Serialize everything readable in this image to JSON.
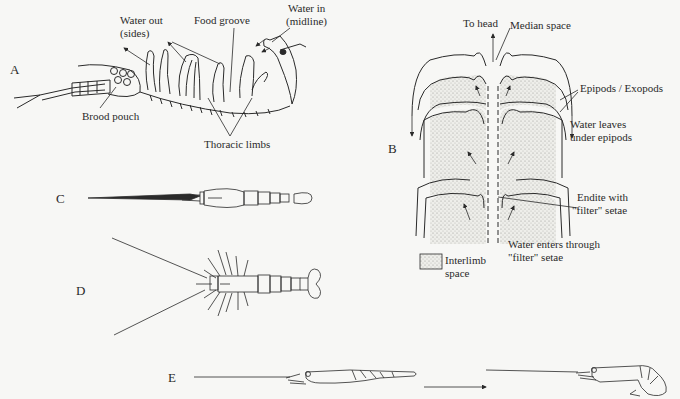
{
  "panels": {
    "A": {
      "letter": "A",
      "labels": {
        "water_out": "Water out",
        "water_out_sides": "(sides)",
        "food_groove": "Food groove",
        "water_in": "Water in",
        "water_in_midline": "(midline)",
        "brood_pouch": "Brood pouch",
        "thoracic_limbs": "Thoracic limbs"
      }
    },
    "B": {
      "letter": "B",
      "labels": {
        "to_head": "To head",
        "median_space": "Median space",
        "epipods_exopods": "Epipods / Exopods",
        "water_leaves_1": "Water leaves",
        "water_leaves_2": "under epipods",
        "endite_1": "Endite with",
        "endite_2": "\"filter\" setae",
        "water_enters_1": "Water enters through",
        "water_enters_2": "\"filter\" setae",
        "legend_1": "Interlimb",
        "legend_2": "space"
      }
    },
    "C": {
      "letter": "C"
    },
    "D": {
      "letter": "D"
    },
    "E": {
      "letter": "E"
    }
  },
  "colors": {
    "ink": "#2a2a2a",
    "background": "#f7f7f5",
    "stipple": "#d9d9d4"
  }
}
